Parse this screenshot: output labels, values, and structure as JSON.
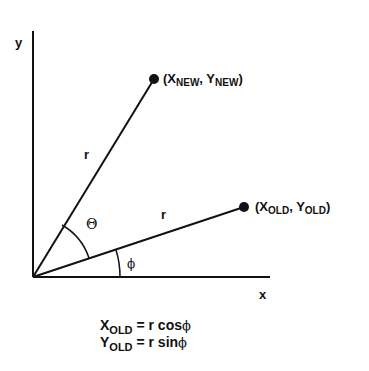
{
  "axes": {
    "y_label": "y",
    "x_label": "x"
  },
  "points": {
    "new": {
      "x_sym": "X",
      "x_sub": "NEW",
      "y_sym": "Y",
      "y_sub": "NEW",
      "open": "(",
      "sep": ", ",
      "close": ")"
    },
    "old": {
      "x_sym": "X",
      "x_sub": "OLD",
      "y_sym": "Y",
      "y_sub": "OLD",
      "open": "(",
      "sep": ", ",
      "close": ")"
    }
  },
  "radius_labels": {
    "new": "r",
    "old": "r"
  },
  "angles": {
    "theta": "Θ",
    "phi": "ϕ"
  },
  "equations": [
    {
      "lhs": "X",
      "lhs_sub": "OLD",
      "rhs": " =  r cos",
      "fn_arg": "ϕ"
    },
    {
      "lhs": "Y",
      "lhs_sub": "OLD",
      "rhs": " =  r sin",
      "fn_arg": "ϕ"
    }
  ],
  "colors": {
    "ink": "#111111",
    "background": "#ffffff"
  }
}
